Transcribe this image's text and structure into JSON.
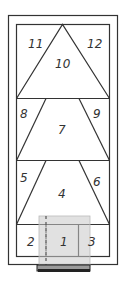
{
  "diagram": {
    "type": "numbered-panel-layout",
    "colors": {
      "line": "#333333",
      "background": "#ffffff",
      "overlay": "#c8c8c8",
      "base_bar": "#222222"
    },
    "regions": [
      {
        "id": "1",
        "label": "1",
        "shape": "rectangle",
        "tier": "bottom",
        "position": "center"
      },
      {
        "id": "2",
        "label": "2",
        "shape": "rectangle",
        "tier": "bottom",
        "position": "left"
      },
      {
        "id": "3",
        "label": "3",
        "shape": "rectangle",
        "tier": "bottom",
        "position": "right"
      },
      {
        "id": "4",
        "label": "4",
        "shape": "trapezoid",
        "tier": "lower",
        "position": "center"
      },
      {
        "id": "5",
        "label": "5",
        "shape": "triangle",
        "tier": "lower",
        "position": "left"
      },
      {
        "id": "6",
        "label": "6",
        "shape": "triangle",
        "tier": "lower",
        "position": "right"
      },
      {
        "id": "7",
        "label": "7",
        "shape": "trapezoid",
        "tier": "middle",
        "position": "center"
      },
      {
        "id": "8",
        "label": "8",
        "shape": "triangle",
        "tier": "middle",
        "position": "left"
      },
      {
        "id": "9",
        "label": "9",
        "shape": "triangle",
        "tier": "middle",
        "position": "right"
      },
      {
        "id": "10",
        "label": "10",
        "shape": "triangle",
        "tier": "top",
        "position": "center"
      },
      {
        "id": "11",
        "label": "11",
        "shape": "triangle",
        "tier": "top",
        "position": "left"
      },
      {
        "id": "12",
        "label": "12",
        "shape": "triangle",
        "tier": "top",
        "position": "right"
      }
    ],
    "labels": {
      "r1": "1",
      "r2": "2",
      "r3": "3",
      "r4": "4",
      "r5": "5",
      "r6": "6",
      "r7": "7",
      "r8": "8",
      "r9": "9",
      "r10": "10",
      "r11": "11",
      "r12": "12"
    }
  }
}
